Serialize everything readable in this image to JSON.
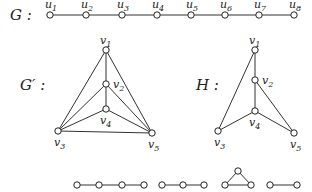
{
  "graphs": {
    "G": {
      "label": "G :",
      "vertices": [
        {
          "id": "u1",
          "label": "u",
          "sub": "1",
          "x": 50,
          "y": 15
        },
        {
          "id": "u2",
          "label": "u",
          "sub": "2",
          "x": 86,
          "y": 15
        },
        {
          "id": "u3",
          "label": "u",
          "sub": "3",
          "x": 122,
          "y": 15
        },
        {
          "id": "u4",
          "label": "u",
          "sub": "4",
          "x": 157,
          "y": 15
        },
        {
          "id": "u5",
          "label": "u",
          "sub": "5",
          "x": 191,
          "y": 15
        },
        {
          "id": "u6",
          "label": "u",
          "sub": "6",
          "x": 225,
          "y": 15
        },
        {
          "id": "u7",
          "label": "u",
          "sub": "7",
          "x": 259,
          "y": 15
        },
        {
          "id": "u8",
          "label": "u",
          "sub": "8",
          "x": 294,
          "y": 15
        }
      ],
      "edges": [
        [
          "u1",
          "u2"
        ],
        [
          "u2",
          "u3"
        ],
        [
          "u3",
          "u4"
        ],
        [
          "u4",
          "u5"
        ],
        [
          "u5",
          "u6"
        ],
        [
          "u6",
          "u7"
        ],
        [
          "u7",
          "u8"
        ]
      ]
    },
    "G_prime": {
      "label": "G′ :",
      "vertices": [
        {
          "id": "v1",
          "label": "v",
          "sub": "1",
          "x": 106,
          "y": 50
        },
        {
          "id": "v2",
          "label": "v",
          "sub": "2",
          "x": 106,
          "y": 84
        },
        {
          "id": "v3",
          "label": "v",
          "sub": "3",
          "x": 58,
          "y": 131
        },
        {
          "id": "v4",
          "label": "v",
          "sub": "4",
          "x": 106,
          "y": 109
        },
        {
          "id": "v5",
          "label": "v",
          "sub": "5",
          "x": 152,
          "y": 133
        }
      ],
      "edges": [
        [
          "v1",
          "v2"
        ],
        [
          "v2",
          "v4"
        ],
        [
          "v1",
          "v3"
        ],
        [
          "v1",
          "v5"
        ],
        [
          "v2",
          "v3"
        ],
        [
          "v2",
          "v5"
        ],
        [
          "v4",
          "v3"
        ],
        [
          "v4",
          "v5"
        ],
        [
          "v3",
          "v5"
        ]
      ]
    },
    "H": {
      "label": "H :",
      "vertices": [
        {
          "id": "v1",
          "label": "v",
          "sub": "1",
          "x": 255,
          "y": 50
        },
        {
          "id": "v2",
          "label": "v",
          "sub": "2",
          "x": 255,
          "y": 80
        },
        {
          "id": "v3",
          "label": "v",
          "sub": "3",
          "x": 218,
          "y": 131
        },
        {
          "id": "v4",
          "label": "v",
          "sub": "4",
          "x": 255,
          "y": 111
        },
        {
          "id": "v5",
          "label": "v",
          "sub": "5",
          "x": 294,
          "y": 133
        }
      ],
      "edges": [
        [
          "v1",
          "v2"
        ],
        [
          "v2",
          "v4"
        ],
        [
          "v1",
          "v3"
        ],
        [
          "v2",
          "v5"
        ],
        [
          "v4",
          "v3"
        ],
        [
          "v4",
          "v5"
        ]
      ]
    },
    "components": [
      {
        "name": "path-4",
        "vertices": [
          [
            77,
            185
          ],
          [
            99,
            185
          ],
          [
            122,
            185
          ],
          [
            144,
            185
          ]
        ],
        "edges": [
          [
            0,
            1
          ],
          [
            1,
            2
          ],
          [
            2,
            3
          ]
        ]
      },
      {
        "name": "path-3",
        "vertices": [
          [
            162,
            185
          ],
          [
            183,
            185
          ],
          [
            204,
            185
          ]
        ],
        "edges": [
          [
            0,
            1
          ],
          [
            1,
            2
          ]
        ]
      },
      {
        "name": "triangle",
        "vertices": [
          [
            238,
            171
          ],
          [
            225,
            185
          ],
          [
            251,
            185
          ]
        ],
        "edges": [
          [
            0,
            1
          ],
          [
            0,
            2
          ],
          [
            1,
            2
          ]
        ]
      },
      {
        "name": "edge",
        "vertices": [
          [
            270,
            185
          ],
          [
            297,
            185
          ]
        ],
        "edges": [
          [
            0,
            1
          ]
        ]
      }
    ]
  }
}
